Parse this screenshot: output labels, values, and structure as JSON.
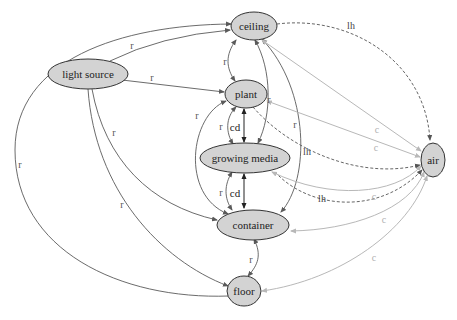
{
  "nodes": {
    "ceiling": {
      "label": "ceiling"
    },
    "light_source": {
      "label": "light source"
    },
    "plant": {
      "label": "plant"
    },
    "growing_media": {
      "label": "growing media"
    },
    "container": {
      "label": "container"
    },
    "floor": {
      "label": "floor"
    },
    "air": {
      "label": "air"
    }
  },
  "edge_labels": {
    "r": "r",
    "cd": "cd",
    "lh": "lh",
    "c": "c"
  },
  "legend_semantics": {
    "r": "radiation",
    "cd": "conduction",
    "lh": "latent heat",
    "c": "convection"
  },
  "edges": [
    {
      "from": "light source",
      "to": "ceiling",
      "type": "r"
    },
    {
      "from": "light source",
      "to": "ceiling",
      "type": "r (outer arc via floor side)"
    },
    {
      "from": "light source",
      "to": "plant",
      "type": "r"
    },
    {
      "from": "light source",
      "to": "container",
      "type": "r"
    },
    {
      "from": "light source",
      "to": "floor",
      "type": "r"
    },
    {
      "from": "ceiling",
      "to": "plant",
      "type": "r"
    },
    {
      "from": "ceiling",
      "to": "growing media",
      "type": "r"
    },
    {
      "from": "ceiling",
      "to": "container",
      "type": "r"
    },
    {
      "from": "ceiling",
      "to": "air",
      "type": "lh"
    },
    {
      "from": "ceiling",
      "to": "air",
      "type": "c"
    },
    {
      "from": "plant",
      "to": "growing media",
      "type": "r"
    },
    {
      "from": "plant",
      "to": "growing media",
      "type": "cd"
    },
    {
      "from": "plant",
      "to": "container",
      "type": "r"
    },
    {
      "from": "plant",
      "to": "air",
      "type": "lh"
    },
    {
      "from": "plant",
      "to": "air",
      "type": "c"
    },
    {
      "from": "growing media",
      "to": "container",
      "type": "r"
    },
    {
      "from": "growing media",
      "to": "container",
      "type": "cd"
    },
    {
      "from": "growing media",
      "to": "air",
      "type": "lh"
    },
    {
      "from": "growing media",
      "to": "air",
      "type": "c"
    },
    {
      "from": "container",
      "to": "floor",
      "type": "r"
    },
    {
      "from": "container",
      "to": "air",
      "type": "c"
    },
    {
      "from": "floor",
      "to": "air",
      "type": "c"
    }
  ]
}
